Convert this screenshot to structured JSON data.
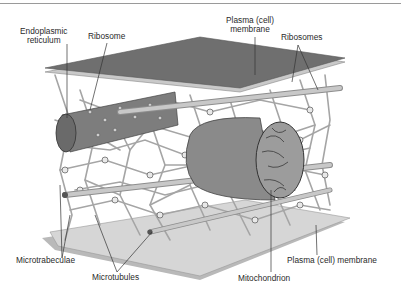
{
  "figure": {
    "labels": {
      "endoplasmic_reticulum_line1": "Endoplasmic",
      "endoplasmic_reticulum_line2": "reticulum",
      "ribosome": "Ribosome",
      "plasma_membrane_top_line1": "Plasma (cell)",
      "plasma_membrane_top_line2": "membrane",
      "ribosomes": "Ribosomes",
      "microtrabeculae": "Microtrabeculae",
      "microtubules": "Microtubules",
      "mitochondrion": "Mitochondrion",
      "plasma_membrane_bottom": "Plasma (cell) membrane"
    },
    "colors": {
      "top_membrane": "#6b6b6b",
      "membrane_edge": "#cfcfcf",
      "bottom_membrane": "#d4d4d4",
      "lattice": "#a8a8a8",
      "organelle": "#7a7a7a",
      "tubule": "#bdbdbd",
      "label_text": "#2a2a2a"
    }
  }
}
